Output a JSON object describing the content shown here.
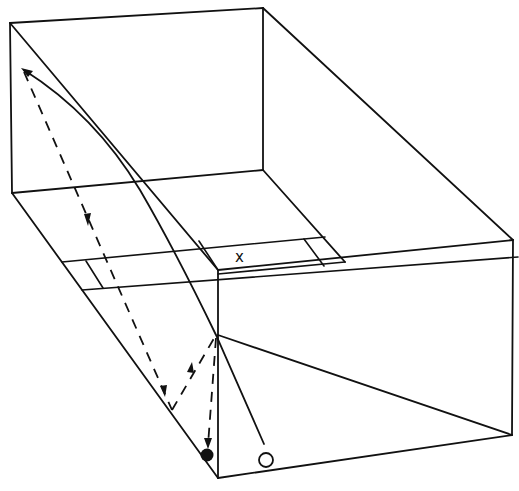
{
  "diagram": {
    "title": "",
    "colors": {
      "line": "#111111",
      "background": "#ffffff"
    },
    "labels": {
      "target_mark": "x"
    },
    "markers": {
      "start": {
        "type": "open-circle",
        "x": 266,
        "y": 460
      },
      "end": {
        "type": "filled-circle",
        "x": 207,
        "y": 455
      }
    },
    "paths": {
      "solid": {
        "description": "curved trajectory from open circle up to the top-left corner with arrowhead"
      },
      "dashed": {
        "description": "return trajectory with arrows: down the left side, bounce near floor, up to front edge, down to filled dot"
      }
    }
  }
}
